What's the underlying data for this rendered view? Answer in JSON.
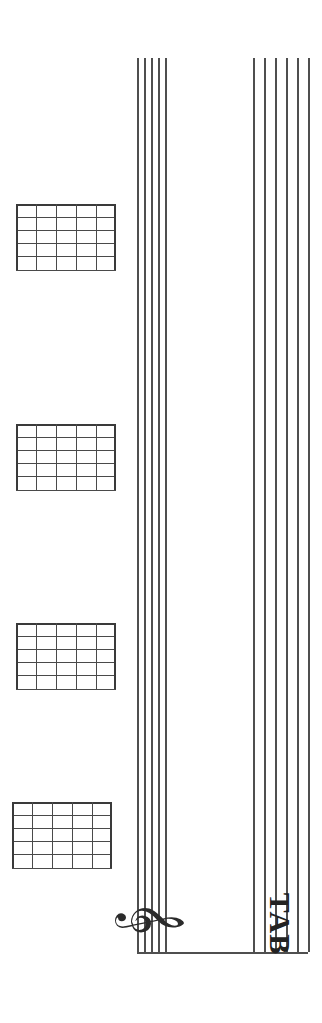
{
  "page": {
    "title": "Guitar Tablature Page",
    "orientation": "rotated-90",
    "background_color": "#ffffff",
    "width": 322,
    "height": 1023
  },
  "notation": {
    "line_color": "#4f4f4f",
    "clef_name": "treble-clef",
    "clef_glyph": "𝄞",
    "tab_label": "TAB",
    "staff_line_count": 5,
    "tab_line_count": 6,
    "staff": {
      "x": 137,
      "width": 28,
      "top": 58,
      "bottom": 952,
      "line_offsets": [
        0,
        7,
        14,
        21,
        28
      ]
    },
    "tab": {
      "x": 253,
      "width": 55,
      "top": 58,
      "bottom": 952,
      "line_offsets": [
        0,
        11,
        22,
        33,
        44,
        55
      ]
    },
    "barline": {
      "x": 137,
      "y": 952,
      "width": 171
    }
  },
  "chord_diagrams": [
    {
      "name": "chord-diagram-1",
      "index": 1,
      "x": 16,
      "y": 204,
      "width": 100,
      "height": 66,
      "frets": 5,
      "strings": 6,
      "fret_offsets": [
        0,
        13,
        26,
        39,
        52,
        66
      ],
      "string_offsets": [
        0,
        20,
        40,
        60,
        80,
        100
      ]
    },
    {
      "name": "chord-diagram-2",
      "index": 2,
      "x": 16,
      "y": 424,
      "width": 100,
      "height": 66,
      "frets": 5,
      "strings": 6,
      "fret_offsets": [
        0,
        13,
        26,
        39,
        52,
        66
      ],
      "string_offsets": [
        0,
        20,
        40,
        60,
        80,
        100
      ]
    },
    {
      "name": "chord-diagram-3",
      "index": 3,
      "x": 16,
      "y": 623,
      "width": 100,
      "height": 66,
      "frets": 5,
      "strings": 6,
      "fret_offsets": [
        0,
        13,
        26,
        39,
        52,
        66
      ],
      "string_offsets": [
        0,
        20,
        40,
        60,
        80,
        100
      ]
    },
    {
      "name": "chord-diagram-4",
      "index": 4,
      "x": 12,
      "y": 802,
      "width": 100,
      "height": 66,
      "frets": 5,
      "strings": 6,
      "fret_offsets": [
        0,
        13,
        26,
        39,
        52,
        66
      ],
      "string_offsets": [
        0,
        20,
        40,
        60,
        80,
        100
      ]
    }
  ],
  "chart_data": {
    "type": "table",
    "title": "Guitar Tablature Page",
    "xlabel": "",
    "ylabel": "",
    "categories": [
      "chord-diagram-1",
      "chord-diagram-2",
      "chord-diagram-3",
      "chord-diagram-4"
    ],
    "values": [
      0,
      0,
      0,
      0
    ]
  }
}
